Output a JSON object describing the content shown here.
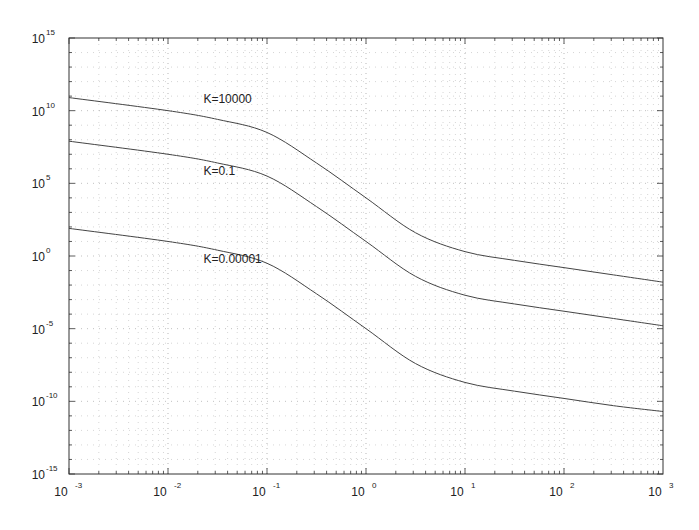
{
  "chart_data": {
    "type": "line",
    "title": "",
    "xlabel": "",
    "ylabel": "",
    "xscale": "log",
    "yscale": "log",
    "xlim": [
      0.001,
      1000
    ],
    "ylim": [
      1e-15,
      1000000000000000.0
    ],
    "grid": true,
    "legend": "none (inline curve labels)",
    "x_ticks": [
      {
        "base": "10",
        "exp": "-3"
      },
      {
        "base": "10",
        "exp": "-2"
      },
      {
        "base": "10",
        "exp": "-1"
      },
      {
        "base": "10",
        "exp": "0"
      },
      {
        "base": "10",
        "exp": "1"
      },
      {
        "base": "10",
        "exp": "2"
      },
      {
        "base": "10",
        "exp": "3"
      }
    ],
    "y_ticks": [
      {
        "base": "10",
        "exp": "15"
      },
      {
        "base": "10",
        "exp": "10"
      },
      {
        "base": "10",
        "exp": "5"
      },
      {
        "base": "10",
        "exp": "0"
      },
      {
        "base": "10",
        "exp": "-5"
      },
      {
        "base": "10",
        "exp": "-10"
      },
      {
        "base": "10",
        "exp": "-15"
      }
    ],
    "x_log10": [
      -3,
      -2,
      -1.5,
      -1,
      -0.5,
      0,
      0.5,
      1,
      1.5,
      2,
      2.5,
      3
    ],
    "series": [
      {
        "name": "K=10000",
        "label_pos": [
          0.025,
          10000000000.0
        ],
        "log10_y": [
          10.9,
          10.0,
          9.4,
          8.5,
          6.4,
          4.0,
          1.6,
          0.3,
          -0.3,
          -0.8,
          -1.3,
          -1.8
        ]
      },
      {
        "name": "K=0.1",
        "label_pos": [
          0.025,
          100000.0
        ],
        "log10_y": [
          7.9,
          7.0,
          6.4,
          5.5,
          3.4,
          1.0,
          -1.4,
          -2.7,
          -3.3,
          -3.8,
          -4.3,
          -4.8
        ]
      },
      {
        "name": "K=0.00001",
        "label_pos": [
          0.025,
          0.1
        ],
        "log10_y": [
          1.9,
          1.0,
          0.4,
          -0.5,
          -2.6,
          -5.0,
          -7.4,
          -8.7,
          -9.3,
          -9.8,
          -10.3,
          -10.7
        ]
      }
    ]
  }
}
